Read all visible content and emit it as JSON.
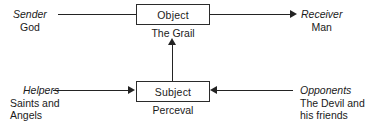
{
  "diagram": {
    "type": "actantial-model",
    "background_color": "#ffffff",
    "stroke_color": "#232323",
    "text_color": "#1a1a1a"
  },
  "nodes": {
    "object": {
      "label": "Object",
      "caption": "The Grail"
    },
    "subject": {
      "label": "Subject",
      "caption": "Perceval"
    }
  },
  "actants": {
    "sender": {
      "role": "Sender",
      "value": "God"
    },
    "receiver": {
      "role": "Receiver",
      "value": "Man"
    },
    "helpers": {
      "role": "Helpers",
      "value_line1": "Saints and",
      "value_line2": "Angels"
    },
    "opponents": {
      "role": "Opponents",
      "value_line1": "The Devil and",
      "value_line2": "his friends"
    }
  },
  "edges": [
    {
      "from": "Sender",
      "to": "Object",
      "arrowhead": "none",
      "orientation": "horizontal"
    },
    {
      "from": "Object",
      "to": "Receiver",
      "arrowhead": "right",
      "orientation": "horizontal"
    },
    {
      "from": "Helpers",
      "to": "Subject",
      "arrowhead": "right",
      "orientation": "horizontal"
    },
    {
      "from": "Opponents",
      "to": "Subject",
      "arrowhead": "left",
      "orientation": "horizontal"
    },
    {
      "from": "Subject",
      "to": "Object",
      "arrowhead": "up",
      "orientation": "vertical"
    }
  ]
}
